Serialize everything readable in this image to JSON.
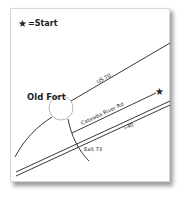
{
  "legend": {
    "symbol": "★",
    "text": "=Start"
  },
  "places": {
    "town": "Old Fort"
  },
  "roads": {
    "us70": "US 70",
    "catawba": "Catawba River Rd",
    "i40": "I-40",
    "exit": "Exit 73"
  },
  "markers": {
    "start_star": "★"
  },
  "colors": {
    "ink": "#222222",
    "paper": "#ffffff",
    "shadow": "#9a9a9a"
  }
}
